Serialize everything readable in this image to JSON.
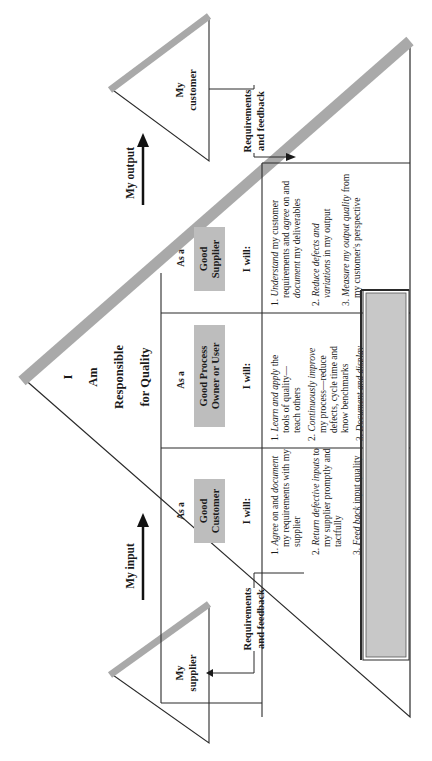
{
  "title": {
    "line1": "I",
    "line2": "Am",
    "line3": "Responsible",
    "line4": "for Quality"
  },
  "customer_triangle": {
    "line1": "My",
    "line2": "customer"
  },
  "supplier_triangle": {
    "line1": "My",
    "line2": "supplier"
  },
  "feedback_customer": {
    "line1": "Requirements",
    "line2": "and feedback"
  },
  "feedback_supplier": {
    "line1": "Requirements",
    "line2": "and feedback"
  },
  "arrows": {
    "input": "My input",
    "output": "My output"
  },
  "colors": {
    "band": "#a9a9a9",
    "role_box": "#bdbdbd",
    "note_box": "#c8c8c8",
    "line": "#2a2a2a"
  },
  "columns": [
    {
      "as_a": "As a",
      "role_line1": "Good",
      "role_line2": "Customer",
      "i_will": "I will:",
      "items": [
        {
          "num": "1.",
          "lines": [
            [
              {
                "t": "Agree",
                "i": true
              },
              {
                "t": " on and "
              },
              {
                "t": "document",
                "i": true
              }
            ],
            [
              {
                "t": "my requirements with my"
              }
            ],
            [
              {
                "t": "supplier"
              }
            ]
          ]
        },
        {
          "num": "2.",
          "lines": [
            [
              {
                "t": "Return defective inputs",
                "i": true
              },
              {
                "t": " to"
              }
            ],
            [
              {
                "t": "my supplier promptly and"
              }
            ],
            [
              {
                "t": "tactfully"
              }
            ]
          ]
        },
        {
          "num": "3.",
          "lines": [
            [
              {
                "t": "Feed back",
                "i": true
              },
              {
                "t": " input quality"
              }
            ],
            [
              {
                "t": "data to my supplier"
              }
            ]
          ]
        }
      ]
    },
    {
      "as_a": "As a",
      "role_line1": "Good Process",
      "role_line2": "Owner or User",
      "i_will": "I will:",
      "items": [
        {
          "num": "1.",
          "lines": [
            [
              {
                "t": "Learn and apply",
                "i": true
              },
              {
                "t": " the"
              }
            ],
            [
              {
                "t": "tools of quality—"
              }
            ],
            [
              {
                "t": "teach others"
              }
            ]
          ]
        },
        {
          "num": "2.",
          "lines": [
            [
              {
                "t": "Continuously improve",
                "i": true
              }
            ],
            [
              {
                "t": "my process—reduce"
              }
            ],
            [
              {
                "t": "defects, cycle time and"
              }
            ],
            [
              {
                "t": "know benchmarks"
              }
            ]
          ]
        },
        {
          "num": "3.",
          "lines": [
            [
              {
                "t": "Document and display",
                "i": true
              }
            ],
            [
              {
                "t": "my process, defect levels,"
              }
            ],
            [
              {
                "t": "and CI projects"
              }
            ]
          ]
        }
      ]
    },
    {
      "as_a": "As a",
      "role_line1": "Good",
      "role_line2": "Supplier",
      "i_will": "I will:",
      "items": [
        {
          "num": "1.",
          "lines": [
            [
              {
                "t": "Understand",
                "i": true
              },
              {
                "t": " my customer"
              }
            ],
            [
              {
                "t": "requirements and "
              },
              {
                "t": "agree",
                "i": true
              },
              {
                "t": " on and"
              }
            ],
            [
              {
                "t": "document",
                "i": true
              },
              {
                "t": " my deliverables"
              }
            ]
          ]
        },
        {
          "num": "2.",
          "lines": [
            [
              {
                "t": "Reduce defects and",
                "i": true
              }
            ],
            [
              {
                "t": "variations",
                "i": true
              },
              {
                "t": " in my output"
              }
            ]
          ]
        },
        {
          "num": "3.",
          "lines": [
            [
              {
                "t": "Measure my output quality",
                "i": true
              },
              {
                "t": " from"
              }
            ],
            [
              {
                "t": "my customer's perspective"
              }
            ]
          ]
        }
      ]
    }
  ]
}
